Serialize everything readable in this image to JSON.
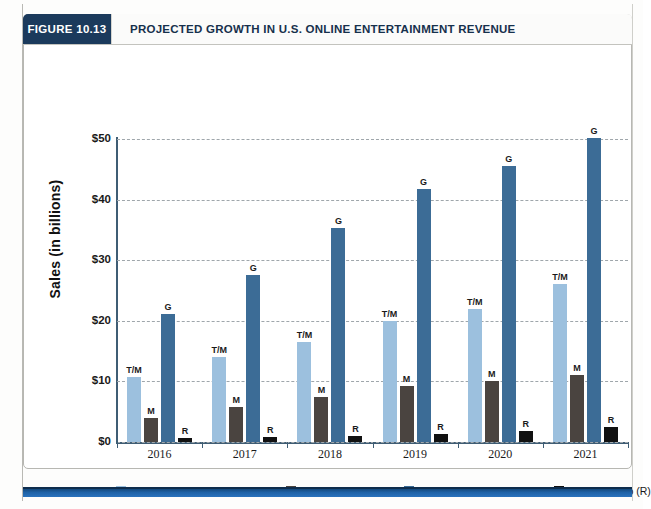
{
  "figure": {
    "number_label": "FIGURE 10.13",
    "title": "PROJECTED GROWTH IN U.S. ONLINE ENTERTAINMENT REVENUE"
  },
  "colors": {
    "header_navy": "#1b3a5c",
    "tv_movies": "#9cc0de",
    "music": "#4a4440",
    "video_games": "#3c6c96",
    "internet_radio": "#111111",
    "axis": "#3f5d74",
    "gridline": "#9fa6ab",
    "footer_blue": "#1f63a8"
  },
  "chart_data": {
    "type": "bar",
    "title": "PROJECTED GROWTH IN U.S. ONLINE ENTERTAINMENT REVENUE",
    "xlabel": "",
    "ylabel": "Sales (in billions)",
    "categories": [
      "2016",
      "2017",
      "2018",
      "2019",
      "2020",
      "2021"
    ],
    "ylim": [
      0,
      50
    ],
    "ytick_values": [
      0,
      10,
      20,
      30,
      40,
      50
    ],
    "ytick_labels": [
      "$0",
      "$10",
      "$20",
      "$30",
      "$40",
      "$50"
    ],
    "grid": "horizontal-dashed",
    "legend_position": "bottom",
    "series": [
      {
        "name": "Online TV and movies (T/M)",
        "short": "T/M",
        "color": "#9cc0de",
        "values": [
          10.8,
          14.0,
          16.5,
          20.0,
          22.0,
          26.0
        ]
      },
      {
        "name": "Online music (M)",
        "short": "M",
        "color": "#4a4440",
        "values": [
          4.0,
          5.7,
          7.5,
          9.2,
          10.0,
          11.0
        ]
      },
      {
        "name": "Online video games (G)",
        "short": "G",
        "color": "#3c6c96",
        "values": [
          21.2,
          27.5,
          35.3,
          41.7,
          45.6,
          50.2
        ]
      },
      {
        "name": "Internet radio (R)",
        "short": "R",
        "color": "#111111",
        "values": [
          0.7,
          0.8,
          1.0,
          1.4,
          1.8,
          2.5
        ]
      }
    ]
  }
}
